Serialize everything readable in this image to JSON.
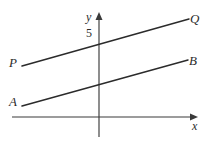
{
  "figure": {
    "type": "coordinate-geometry-diagram",
    "background_color": "#ffffff",
    "line_color": "#2b2b2b",
    "axis_color": "#3a3a3a",
    "axes": {
      "x_axis": {
        "label": "x",
        "arrow": "right",
        "y_pixel": 117,
        "x_start_pixel": 12,
        "x_end_pixel": 196
      },
      "y_axis": {
        "label": "y",
        "arrow": "up",
        "x_pixel": 99,
        "y_top_pixel": 14,
        "y_bottom_pixel": 137
      },
      "tick_labels": [
        {
          "text": "5",
          "axis": "y",
          "value": 5
        }
      ]
    },
    "lines": [
      {
        "name": "line-PQ",
        "start_label": "P",
        "end_label": "Q",
        "start_pixel": [
          22,
          66
        ],
        "end_pixel": [
          189,
          19
        ],
        "y_intercept_label": "5",
        "y_intercept_pixel": [
          99,
          44
        ]
      },
      {
        "name": "line-AB",
        "start_label": "A",
        "end_label": "B",
        "start_pixel": [
          22,
          106
        ],
        "end_pixel": [
          188,
          60
        ],
        "y_intercept_pixel": [
          99,
          84
        ]
      }
    ],
    "labels": {
      "P": "P",
      "Q": "Q",
      "A": "A",
      "B": "B",
      "x": "x",
      "y": "y",
      "five": "5"
    }
  }
}
